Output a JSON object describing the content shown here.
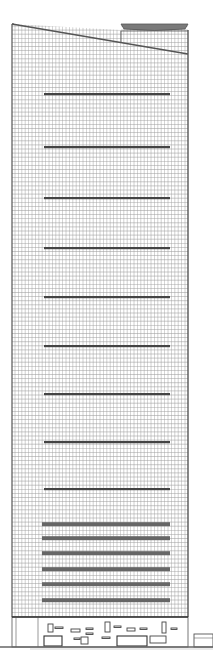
{
  "drawing": {
    "type": "architectural-elevation",
    "subject": "skyscraper tower facade",
    "colors": {
      "background": "#ffffff",
      "line": "#555555",
      "grid": "#9a9a9a",
      "band": "#444444",
      "ground": "#666666"
    },
    "tower": {
      "left": 12,
      "right": 188,
      "base_y": 617,
      "roof_left_y": 24,
      "roof_right_y": 54,
      "crown": {
        "x1": 121,
        "x2": 188,
        "y_top": 24,
        "cap_y": 26
      }
    },
    "mechanical_bands_y": [
      94,
      147,
      198,
      248,
      297,
      346,
      394,
      442,
      489
    ],
    "stacked_bands_y": [
      524,
      538,
      553,
      569,
      584,
      600
    ],
    "band_x": [
      42,
      170
    ],
    "podium": {
      "y_top": 617,
      "y_bottom": 647
    },
    "ground_y": 647,
    "annex": {
      "x1": 194,
      "x2": 213,
      "y_top": 634
    }
  }
}
